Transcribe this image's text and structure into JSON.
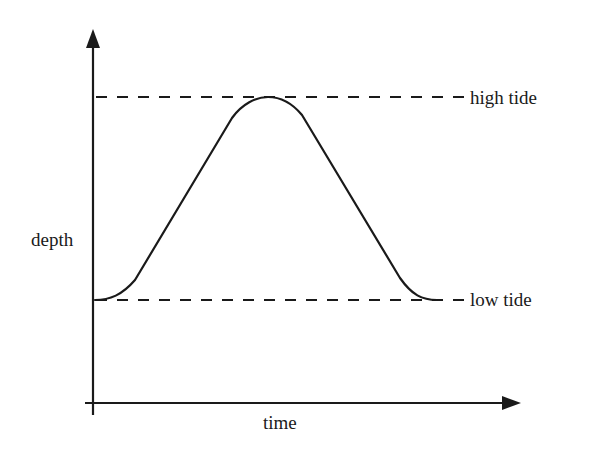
{
  "diagram": {
    "title": "",
    "axes": {
      "x_label": "time",
      "y_label": "depth"
    },
    "reference_lines": [
      {
        "name": "high tide",
        "label": "high tide",
        "style": "dashed",
        "level": "high"
      },
      {
        "name": "low tide",
        "label": "low tide",
        "style": "dashed",
        "level": "low"
      }
    ],
    "curve": {
      "description": "Smooth rise from low tide to a rounded peak at high tide, then a symmetric fall back to low tide",
      "shape": "single tidal cycle (trapezoid-like bell curve with rounded corners)"
    },
    "colors": {
      "line": "#1a1a1a",
      "background": "#ffffff"
    }
  },
  "labels": {
    "high_tide": "high tide",
    "low_tide": "low tide",
    "depth": "depth",
    "time": "time"
  }
}
